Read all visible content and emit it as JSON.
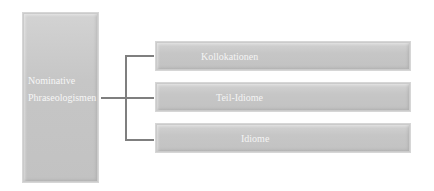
{
  "diagram": {
    "type": "tree",
    "root": {
      "label_lines": [
        "Nominative",
        "Phraseologismen"
      ]
    },
    "children": [
      {
        "label": "Kollokationen"
      },
      {
        "label": "Teil-Idiome"
      },
      {
        "label": "Idiome"
      }
    ],
    "colors": {
      "box_fill": "#c4c4c4",
      "box_border": "#d6d6d6",
      "text": "#f4f4f4",
      "connector": "#7f7f7f",
      "background": "#ffffff"
    }
  }
}
